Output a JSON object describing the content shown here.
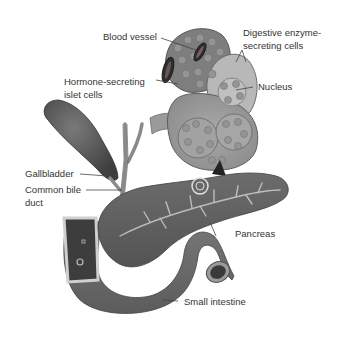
{
  "figure": {
    "labels": {
      "blood_vessel": "Blood vessel",
      "digestive_cells_1": "Digestive enzyme-",
      "digestive_cells_2": "secreting cells",
      "hormone_cells_1": "Hormone-secreting",
      "hormone_cells_2": "islet cells",
      "nucleus": "Nucleus",
      "gallbladder": "Gallbladder",
      "common_bile_duct_1": "Common bile",
      "common_bile_duct_2": "duct",
      "pancreas": "Pancreas",
      "small_intestine": "Small intestine"
    },
    "colors": {
      "label_text": "#333333",
      "leader_line": "#444444",
      "tissue_dark": "#5a5a5a",
      "tissue_mid": "#8a8a8a",
      "tissue_light": "#b5b5b5",
      "cell_fill": "#a8a8a8",
      "background": "#ffffff"
    }
  }
}
